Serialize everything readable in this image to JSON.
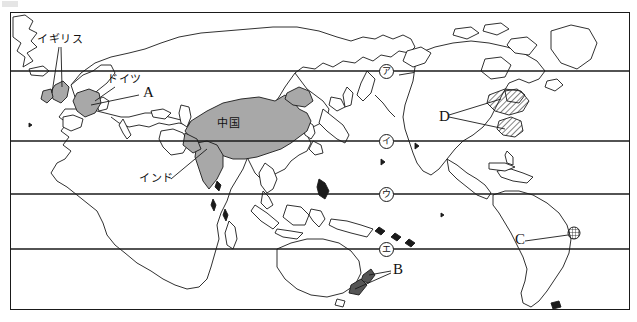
{
  "document": {
    "type": "world-map-worksheet",
    "title": "World map with marked countries and latitude lines",
    "width": 637,
    "height": 322
  },
  "colors": {
    "land_fill_highlight": "#a8a8a8",
    "land_outline": "#1a1a1a",
    "latitude_line": "#1a1a1a",
    "background": "#ffffff",
    "text": "#111111",
    "new_zealand_fill": "#555555"
  },
  "map": {
    "frame": {
      "x": 10,
      "y": 12,
      "width": 620,
      "height": 298
    },
    "latitude_lines": [
      {
        "name": "line-1",
        "y": 58
      },
      {
        "name": "line-2",
        "y": 128
      },
      {
        "name": "line-3",
        "y": 181
      },
      {
        "name": "line-4",
        "y": 236
      }
    ]
  },
  "country_labels": [
    {
      "id": "uk",
      "text": "イギリス",
      "x": 30,
      "y": 26,
      "leader_to": [
        [
          52,
          76
        ],
        [
          44,
          72
        ]
      ]
    },
    {
      "id": "germany",
      "text": "ドイツ",
      "x": 100,
      "y": 70,
      "leader_to": [
        [
          76,
          92
        ]
      ]
    },
    {
      "id": "china",
      "text": "中国",
      "x": 215,
      "y": 113,
      "leader_to": []
    },
    {
      "id": "india",
      "text": "インド",
      "x": 158,
      "y": 168,
      "leader_to": [
        [
          196,
          140
        ]
      ]
    }
  ],
  "alpha_labels": [
    {
      "id": "A",
      "text": "A",
      "x": 141,
      "y": 80,
      "points_to": "germany"
    },
    {
      "id": "B",
      "text": "B",
      "x": 390,
      "y": 259,
      "points_to": "new-zealand"
    },
    {
      "id": "C",
      "text": "C",
      "x": 514,
      "y": 224,
      "points_to": "south-america-site"
    },
    {
      "id": "D",
      "text": "D",
      "x": 443,
      "y": 105,
      "points_to": "north-america-hatched-regions"
    }
  ],
  "circled_markers": [
    {
      "id": "marker-a",
      "text": "ア",
      "x": 385,
      "y": 72
    },
    {
      "id": "marker-i",
      "text": "イ",
      "x": 385,
      "y": 140
    },
    {
      "id": "marker-u",
      "text": "ウ",
      "x": 385,
      "y": 193
    },
    {
      "id": "marker-e",
      "text": "エ",
      "x": 385,
      "y": 248
    }
  ],
  "highlighted_regions": [
    {
      "id": "china",
      "style": "gray-fill",
      "label": "中国"
    },
    {
      "id": "india",
      "style": "gray-fill",
      "label": "インド"
    },
    {
      "id": "uk",
      "style": "gray-fill",
      "label": "イギリス"
    },
    {
      "id": "germany",
      "style": "gray-fill",
      "label": "ドイツ"
    },
    {
      "id": "usa-hatched-north",
      "style": "diagonal-hatch",
      "label": "D"
    },
    {
      "id": "usa-hatched-south",
      "style": "diagonal-hatch",
      "label": "D"
    },
    {
      "id": "south-america-site",
      "style": "cross-hatch-circle",
      "label": "C"
    },
    {
      "id": "new-zealand",
      "style": "dark-fill",
      "label": "B"
    }
  ]
}
